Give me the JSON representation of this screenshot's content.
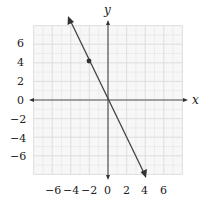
{
  "chart_data": {
    "type": "line",
    "title": "",
    "xlabel": "x",
    "ylabel": "y",
    "xlim": [
      -8,
      8
    ],
    "ylim": [
      -8,
      8
    ],
    "grid": true,
    "x_ticks": [
      "-6",
      "-4",
      "-2",
      "0",
      "2",
      "4",
      "6"
    ],
    "y_ticks": [
      "6",
      "4",
      "2",
      "0",
      "-2",
      "-4",
      "-6"
    ],
    "series": [
      {
        "name": "line",
        "equation": "y = -2x",
        "x": [
          -3.8,
          4
        ],
        "y": [
          7.6,
          -8
        ],
        "arrows": "both",
        "color": "#333333"
      }
    ],
    "points": [
      {
        "x": -2,
        "y": 4
      }
    ]
  },
  "labels": {
    "x_axis": "x",
    "y_axis": "y",
    "xticks": [
      "−6",
      "−4",
      "−2",
      "0",
      "2",
      "4",
      "6"
    ],
    "yticks": [
      "6",
      "4",
      "2",
      "0",
      "−2",
      "−4",
      "−6"
    ]
  }
}
